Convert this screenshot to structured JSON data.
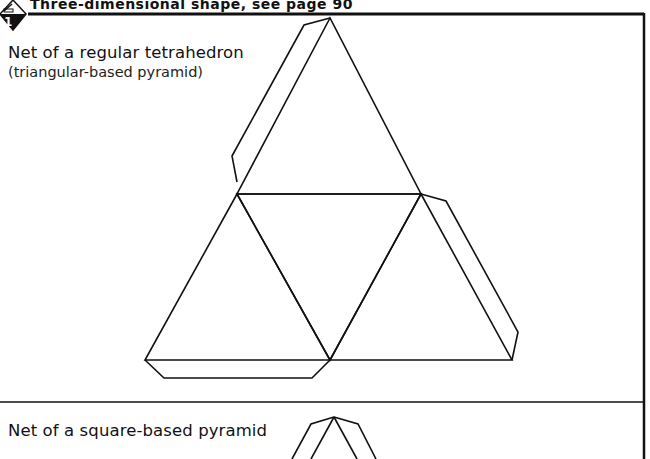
{
  "header": {
    "title": "Three-dimensional shape, see page 90",
    "badge_number": "1",
    "icon": "pencil-icon"
  },
  "sections": [
    {
      "title": "Net of a regular tetrahedron",
      "subtitle": "(triangular-based pyramid)"
    },
    {
      "title": "Net of a square-based pyramid"
    }
  ],
  "colors": {
    "ink": "#111111",
    "paper": "#ffffff"
  }
}
